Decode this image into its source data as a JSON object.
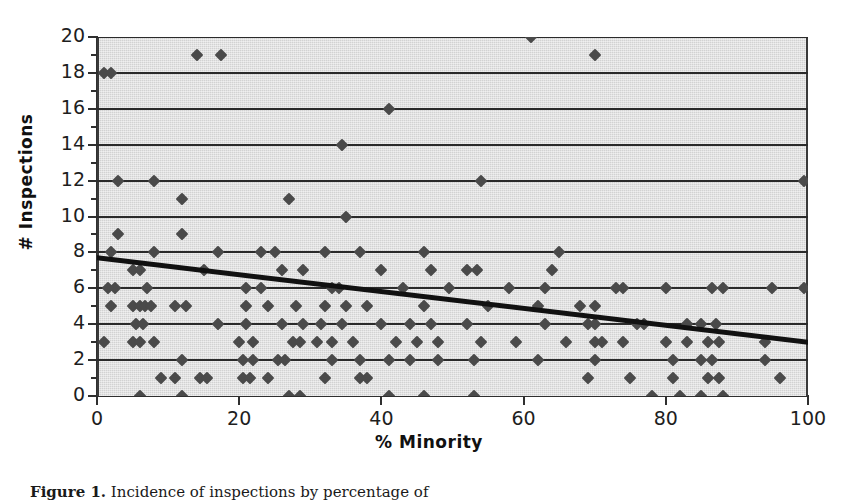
{
  "figure": {
    "caption_label": "Figure 1.",
    "caption_text": "Incidence of inspections by percentage of"
  },
  "chart_data": {
    "type": "scatter",
    "title": "",
    "xlabel": "% Minority",
    "ylabel": "# Inspections",
    "xlim": [
      0,
      100
    ],
    "ylim": [
      0,
      20
    ],
    "xticks": [
      0,
      20,
      40,
      60,
      80,
      100
    ],
    "yticks": [
      0,
      2,
      4,
      6,
      8,
      10,
      12,
      14,
      16,
      18,
      20
    ],
    "grid": "horizontal",
    "legend": "none",
    "marker": "diamond",
    "marker_color": "#4a4a4a",
    "plot_background": "#d2d2d2",
    "gridline_color": "#2b2b2b",
    "trendline": {
      "type": "linear",
      "color": "#111111",
      "width_px": 5,
      "x_start": 0,
      "y_start": 7.7,
      "x_end": 100,
      "y_end": 3.0
    },
    "points": [
      [
        1,
        18
      ],
      [
        2,
        18
      ],
      [
        14,
        19
      ],
      [
        17.5,
        19
      ],
      [
        61,
        20
      ],
      [
        70,
        19
      ],
      [
        41,
        16
      ],
      [
        34.5,
        14
      ],
      [
        3,
        12
      ],
      [
        8,
        12
      ],
      [
        54,
        12
      ],
      [
        99.5,
        12
      ],
      [
        12,
        11
      ],
      [
        27,
        11
      ],
      [
        35,
        10
      ],
      [
        3,
        9
      ],
      [
        12,
        9
      ],
      [
        2,
        8
      ],
      [
        8,
        8
      ],
      [
        17,
        8
      ],
      [
        23,
        8
      ],
      [
        25,
        8
      ],
      [
        32,
        8
      ],
      [
        37,
        8
      ],
      [
        46,
        8
      ],
      [
        65,
        8
      ],
      [
        5,
        7
      ],
      [
        6,
        7
      ],
      [
        15,
        7
      ],
      [
        26,
        7
      ],
      [
        29,
        7
      ],
      [
        40,
        7
      ],
      [
        47,
        7
      ],
      [
        52,
        7
      ],
      [
        53.5,
        7
      ],
      [
        64,
        7
      ],
      [
        1.5,
        6
      ],
      [
        2.5,
        6
      ],
      [
        7,
        6
      ],
      [
        21,
        6
      ],
      [
        23,
        6
      ],
      [
        33,
        6
      ],
      [
        34,
        6
      ],
      [
        43,
        6
      ],
      [
        49.5,
        6
      ],
      [
        58,
        6
      ],
      [
        63,
        6
      ],
      [
        73,
        6
      ],
      [
        74,
        6
      ],
      [
        80,
        6
      ],
      [
        86.5,
        6
      ],
      [
        88,
        6
      ],
      [
        95,
        6
      ],
      [
        99.5,
        6
      ],
      [
        2,
        5
      ],
      [
        5,
        5
      ],
      [
        6,
        5
      ],
      [
        6.8,
        5
      ],
      [
        7.6,
        5
      ],
      [
        11,
        5
      ],
      [
        12.5,
        5
      ],
      [
        21,
        5
      ],
      [
        24,
        5
      ],
      [
        28,
        5
      ],
      [
        32,
        5
      ],
      [
        35,
        5
      ],
      [
        38,
        5
      ],
      [
        46,
        5
      ],
      [
        55,
        5
      ],
      [
        62,
        5
      ],
      [
        68,
        5
      ],
      [
        70,
        5
      ],
      [
        5.5,
        4
      ],
      [
        6.5,
        4
      ],
      [
        17,
        4
      ],
      [
        21,
        4
      ],
      [
        26,
        4
      ],
      [
        29,
        4
      ],
      [
        31.5,
        4
      ],
      [
        34.5,
        4
      ],
      [
        40,
        4
      ],
      [
        44,
        4
      ],
      [
        47,
        4
      ],
      [
        52,
        4
      ],
      [
        63,
        4
      ],
      [
        69,
        4
      ],
      [
        70,
        4
      ],
      [
        76,
        4
      ],
      [
        77,
        4
      ],
      [
        83,
        4
      ],
      [
        85,
        4
      ],
      [
        87,
        4
      ],
      [
        1,
        3
      ],
      [
        5,
        3
      ],
      [
        6,
        3
      ],
      [
        8,
        3
      ],
      [
        20,
        3
      ],
      [
        22,
        3
      ],
      [
        27.5,
        3
      ],
      [
        28.5,
        3
      ],
      [
        31,
        3
      ],
      [
        33,
        3
      ],
      [
        36,
        3
      ],
      [
        42,
        3
      ],
      [
        45,
        3
      ],
      [
        48,
        3
      ],
      [
        54,
        3
      ],
      [
        59,
        3
      ],
      [
        66,
        3
      ],
      [
        70,
        3
      ],
      [
        71,
        3
      ],
      [
        74,
        3
      ],
      [
        80,
        3
      ],
      [
        83,
        3
      ],
      [
        86,
        3
      ],
      [
        87.5,
        3
      ],
      [
        94,
        3
      ],
      [
        12,
        2
      ],
      [
        20.5,
        2
      ],
      [
        22,
        2
      ],
      [
        25.5,
        2
      ],
      [
        26.5,
        2
      ],
      [
        33,
        2
      ],
      [
        37,
        2
      ],
      [
        41,
        2
      ],
      [
        44,
        2
      ],
      [
        48,
        2
      ],
      [
        53,
        2
      ],
      [
        62,
        2
      ],
      [
        70,
        2
      ],
      [
        81,
        2
      ],
      [
        85,
        2
      ],
      [
        86.5,
        2
      ],
      [
        94,
        2
      ],
      [
        9,
        1
      ],
      [
        11,
        1
      ],
      [
        14.5,
        1
      ],
      [
        15.5,
        1
      ],
      [
        20.5,
        1
      ],
      [
        21.5,
        1
      ],
      [
        24,
        1
      ],
      [
        32,
        1
      ],
      [
        37,
        1
      ],
      [
        38,
        1
      ],
      [
        69,
        1
      ],
      [
        75,
        1
      ],
      [
        81,
        1
      ],
      [
        86,
        1
      ],
      [
        87.5,
        1
      ],
      [
        96,
        1
      ],
      [
        6,
        0
      ],
      [
        12,
        0
      ],
      [
        27,
        0
      ],
      [
        28.5,
        0
      ],
      [
        41,
        0
      ],
      [
        46,
        0
      ],
      [
        53,
        0
      ],
      [
        78,
        0
      ],
      [
        82,
        0
      ],
      [
        85,
        0
      ],
      [
        88,
        0
      ]
    ]
  }
}
